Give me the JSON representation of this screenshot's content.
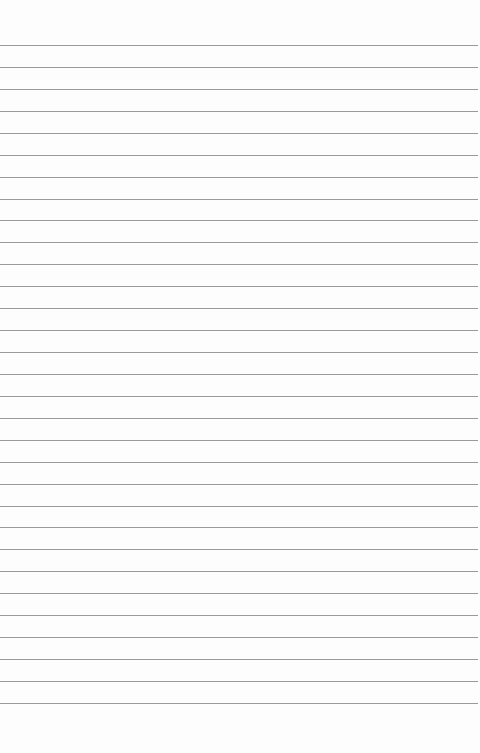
{
  "paper": {
    "type": "lined-paper",
    "background_color": "#fdfdfd",
    "line_color": "#9a9a9a",
    "line_count": 31,
    "first_line_y": 45,
    "line_spacing": 21.93
  }
}
